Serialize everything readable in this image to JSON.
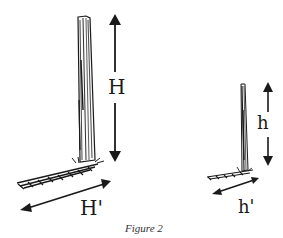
{
  "figure": {
    "caption": "Figure 2",
    "large_object": {
      "height_label": "H",
      "shadow_label": "H'"
    },
    "small_object": {
      "height_label": "h",
      "shadow_label": "h'"
    },
    "colors": {
      "ink": "#1a1a1a",
      "background": "#ffffff"
    }
  }
}
